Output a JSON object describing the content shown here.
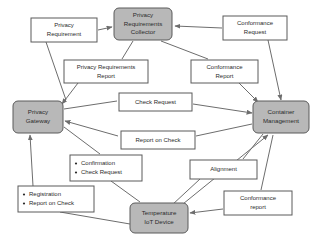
{
  "diagram": {
    "type": "flow-diagram",
    "background_color": "#ffffff",
    "node_fill_color": "#b8b8b8",
    "node_border_color": "#5a5a5a",
    "label_fill_color": "#ffffff",
    "edge_color": "#6d6d6d",
    "nodes": [
      {
        "id": "privacy-requirements-collector",
        "lines": [
          "Privacy",
          "Requirements",
          "Collector"
        ],
        "x": 114,
        "y": 8,
        "w": 58,
        "h": 32
      },
      {
        "id": "privacy-gateway",
        "lines": [
          "Privacy",
          "Gateway"
        ],
        "x": 13,
        "y": 101,
        "w": 50,
        "h": 32
      },
      {
        "id": "container-management",
        "lines": [
          "Container",
          "Management"
        ],
        "x": 253,
        "y": 101,
        "w": 56,
        "h": 32
      },
      {
        "id": "temperature-iot-device",
        "lines": [
          "Temperature",
          "IoT Device"
        ],
        "x": 130,
        "y": 203,
        "w": 58,
        "h": 30
      }
    ],
    "labels": [
      {
        "id": "privacy-requirement",
        "lines": [
          "Privacy",
          "Requirement"
        ],
        "x": 31,
        "y": 18,
        "w": 66,
        "h": 24,
        "bulleted": false
      },
      {
        "id": "conformance-request",
        "lines": [
          "Conformance",
          "Request"
        ],
        "x": 223,
        "y": 16,
        "w": 64,
        "h": 24,
        "bulleted": false
      },
      {
        "id": "privacy-requirements-report",
        "lines": [
          "Privacy Requirements",
          "Report"
        ],
        "x": 64,
        "y": 60,
        "w": 84,
        "h": 23,
        "bulleted": false
      },
      {
        "id": "conformance-report-top",
        "lines": [
          "Conformance",
          "Report"
        ],
        "x": 191,
        "y": 60,
        "w": 67,
        "h": 23,
        "bulleted": false
      },
      {
        "id": "check-request",
        "lines": [
          "Check Request"
        ],
        "x": 119,
        "y": 93,
        "w": 73,
        "h": 18,
        "bulleted": false
      },
      {
        "id": "report-on-check",
        "lines": [
          "Report on Check"
        ],
        "x": 121,
        "y": 131,
        "w": 74,
        "h": 18,
        "bulleted": false
      },
      {
        "id": "confirmation-check-request",
        "lines": [
          "Confirmation",
          "Check Request"
        ],
        "x": 70,
        "y": 155,
        "w": 72,
        "h": 26,
        "bulleted": true
      },
      {
        "id": "registration-report-on-check",
        "lines": [
          "Registration",
          "Report on Check"
        ],
        "x": 18,
        "y": 186,
        "w": 76,
        "h": 26,
        "bulleted": true
      },
      {
        "id": "alignment",
        "lines": [
          "Alignment"
        ],
        "x": 190,
        "y": 160,
        "w": 67,
        "h": 19,
        "bulleted": false
      },
      {
        "id": "conformance-report-bottom",
        "lines": [
          "Conformance",
          "report"
        ],
        "x": 224,
        "y": 191,
        "w": 68,
        "h": 24,
        "bulleted": false
      }
    ],
    "edges": [
      {
        "id": "privacy-requirement-to-collector",
        "d": "M 98,30 L 112,27",
        "arrow": true
      },
      {
        "id": "conformance-request-to-collector",
        "d": "M 222,28 L 175,26",
        "arrow": true
      },
      {
        "id": "privacy-requirement-to-gateway",
        "d": "M 46,42 L 66,100",
        "arrow": false
      },
      {
        "id": "conformance-request-to-container",
        "d": "M 268,40 L 281,100",
        "arrow": true
      },
      {
        "id": "collector-to-requirements-report",
        "d": "M 133,41 L 122,59",
        "arrow": false
      },
      {
        "id": "requirements-report-to-gateway",
        "d": "M 78,83 L 62,104",
        "arrow": true
      },
      {
        "id": "collector-to-conformance-report",
        "d": "M 161,41 L 208,59",
        "arrow": false
      },
      {
        "id": "conformance-report-to-container",
        "d": "M 239,83 L 258,102",
        "arrow": true
      },
      {
        "id": "gateway-to-check-request",
        "d": "M 64,109 L 117,101",
        "arrow": false
      },
      {
        "id": "check-request-to-container",
        "d": "M 193,104 L 252,113",
        "arrow": true
      },
      {
        "id": "container-to-report-on-check",
        "d": "M 252,124 L 196,136",
        "arrow": false
      },
      {
        "id": "report-on-check-to-gateway",
        "d": "M 118,136 L 65,121",
        "arrow": true
      },
      {
        "id": "gateway-to-confirmation",
        "d": "M 64,127 L 100,154",
        "arrow": false
      },
      {
        "id": "confirmation-to-device",
        "d": "M 111,181 L 140,202",
        "arrow": false
      },
      {
        "id": "device-to-gateway-registration",
        "d": "M 130,224 L 60,212",
        "arrow": false
      },
      {
        "id": "registration-to-gateway",
        "d": "M 33,186 L 30,135",
        "arrow": true
      },
      {
        "id": "container-to-alignment",
        "d": "M 263,134 L 243,159",
        "arrow": false
      },
      {
        "id": "alignment-to-device",
        "d": "M 200,179 L 172,205",
        "arrow": false
      },
      {
        "id": "device-to-container-alignment",
        "d": "M 178,208 L 268,135",
        "arrow": true
      },
      {
        "id": "conformance-report-bottom-to-device",
        "d": "M 223,209 L 190,213",
        "arrow": true
      },
      {
        "id": "container-to-conformance-report-bottom",
        "d": "M 273,135 L 261,190",
        "arrow": false
      }
    ]
  }
}
